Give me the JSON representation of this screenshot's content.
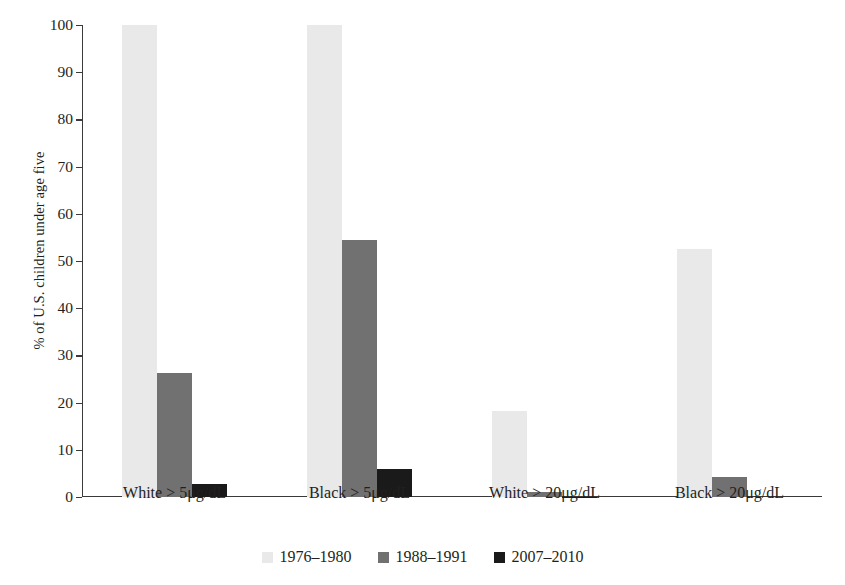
{
  "chart_data": {
    "type": "bar",
    "title": "",
    "subtitle": "",
    "xlabel": "",
    "ylabel": "% of U.S. children under age five",
    "ylim": [
      0,
      100
    ],
    "ytick_step": 10,
    "yticks": [
      0,
      10,
      20,
      30,
      40,
      50,
      60,
      70,
      80,
      90,
      100
    ],
    "ytick_labels": [
      "0",
      "10",
      "20",
      "30",
      "40",
      "50",
      "60",
      "70",
      "80",
      "90",
      "100"
    ],
    "grid": false,
    "legend_position": "bottom-center",
    "categories": [
      "White > 5μg/dL",
      "Black > 5μg/dL",
      "White > 20μg/dL",
      "Black > 20μg/dL"
    ],
    "series": [
      {
        "name": "1976–1980",
        "color": "#e9e9e9",
        "values": [
          100,
          100,
          18.3,
          52.5
        ]
      },
      {
        "name": "1988–1991",
        "color": "#717171",
        "values": [
          26.2,
          54.4,
          1.0,
          4.3
        ]
      },
      {
        "name": "2007–2010",
        "color": "#1a1a1a",
        "values": [
          2.7,
          5.9,
          0.1,
          0
        ]
      }
    ]
  },
  "colors": {
    "axis": "#3c3a39",
    "text": "#231f1e",
    "background": "#ffffff",
    "series_1976_1980": "#e9e9e9",
    "series_1988_1991": "#717171",
    "series_2007_2010": "#1a1a1a"
  }
}
